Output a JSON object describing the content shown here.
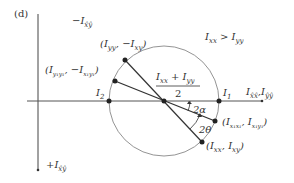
{
  "panel_label": "(d)",
  "axes": {
    "vertical_top": "−I",
    "vertical_top_sub": "x̂ŷ",
    "vertical_bottom": "+I",
    "vertical_bottom_sub": "x̂ŷ",
    "horizontal_main": "I",
    "horizontal_sub1": "x̂x̂",
    "horizontal_sep": ",",
    "horizontal_main2": "I",
    "horizontal_sub2": "ŷŷ"
  },
  "condition": {
    "a": "I",
    "a_sub": "xx",
    "op": " > ",
    "b": "I",
    "b_sub": "yy"
  },
  "center_label": {
    "num_a": "I",
    "num_a_sub": "xx",
    "plus": " + ",
    "num_b": "I",
    "num_b_sub": "yy",
    "den": "2"
  },
  "points": {
    "p_yy": {
      "open": "(",
      "a": "I",
      "a_sub": "yy",
      "sep": ", −",
      "b": "I",
      "b_sub": "xy",
      "close": ")"
    },
    "p_y1y1": {
      "open": "(",
      "a": "I",
      "a_sub": "y₁y₁",
      "sep": ", −",
      "b": "I",
      "b_sub": "x₁y₁",
      "close": ")"
    },
    "p_x1x1": {
      "open": "(",
      "a": "I",
      "a_sub": "x₁x₁",
      "sep": ", ",
      "b": "I",
      "b_sub": "x₁y₁",
      "close": ")"
    },
    "p_xx": {
      "open": "(",
      "a": "I",
      "a_sub": "xx",
      "sep": ", ",
      "b": "I",
      "b_sub": "xy",
      "close": ")"
    }
  },
  "principal": {
    "i1": "I",
    "i1_sub": "1",
    "i2": "I",
    "i2_sub": "2"
  },
  "angles": {
    "two_alpha": "2α",
    "two_theta": "2θ"
  },
  "colors": {
    "ink": "#333333",
    "circle": "#888888"
  }
}
